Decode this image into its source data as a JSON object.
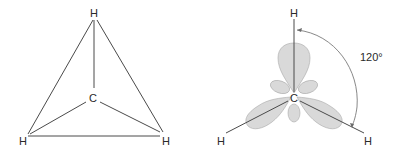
{
  "left_diagram": {
    "name": "methane-triangle-projection",
    "center_atom": "C",
    "top_atom": "H",
    "bottom_left_atom": "H",
    "bottom_right_atom": "H"
  },
  "right_diagram": {
    "name": "sp2-orbital-diagram",
    "center_atom": "C",
    "top_atom": "H",
    "bottom_left_atom": "H",
    "bottom_right_atom": "H",
    "angle_label": "120°"
  },
  "colors": {
    "lobe_fill": "#d9d9d9",
    "line": "#4a4a4a",
    "text": "#2a2a2a"
  }
}
